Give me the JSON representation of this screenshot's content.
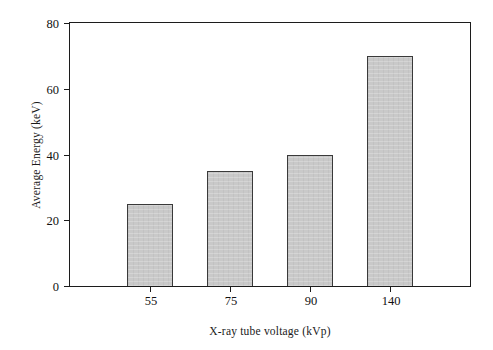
{
  "chart_data": {
    "type": "bar",
    "title": "",
    "categories": [
      "55",
      "75",
      "90",
      "140"
    ],
    "values": [
      25,
      35,
      40,
      70
    ],
    "series": [
      {
        "name": "Average Energy",
        "values": [
          25,
          35,
          40,
          70
        ]
      }
    ],
    "xlabel": "X-ray tube voltage (kVp)",
    "ylabel": "Average Energy (keV)",
    "ylim": [
      0,
      80
    ],
    "ytick_labels": [
      "0",
      "20",
      "40",
      "60",
      "80"
    ],
    "ytick_values": [
      0,
      20,
      40,
      60,
      80
    ],
    "xtick_labels": [
      "55",
      "75",
      "90",
      "140"
    ],
    "grid": false,
    "legend": false,
    "legend_position": "none",
    "bar_fill_color": "#c9c9c9",
    "bar_edge_color": "#3a3a3a",
    "axis_color": "#1c1c1c",
    "background_color": "#ffffff"
  }
}
